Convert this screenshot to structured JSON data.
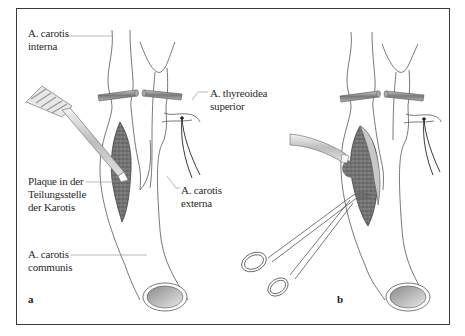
{
  "figure": {
    "panels": [
      {
        "id": "a",
        "letter": "a"
      },
      {
        "id": "b",
        "letter": "b"
      }
    ],
    "labels": {
      "carotis_interna": {
        "line1": "A. carotis",
        "line2": "interna"
      },
      "thyreoidea_superior": {
        "line1": "A. thyreoidea",
        "line2": "superior"
      },
      "plaque": {
        "line1": "Plaque in der",
        "line2": "Teilungsstelle",
        "line3": "der Karotis"
      },
      "carotis_externa": {
        "line1": "A. carotis",
        "line2": "externa"
      },
      "carotis_communis": {
        "line1": "A. carotis",
        "line2": "communis"
      }
    },
    "colors": {
      "frame": "#3a3a3a",
      "vessel_outline": "#555555",
      "plaque_fill": "#6e6e6e",
      "clamp_band": "#8a8a8a",
      "label_text": "#2a2a2a",
      "leader_line": "#8c8c8c"
    },
    "instruments": {
      "panel_a": "dissector-spatula",
      "panel_b": [
        "suction-tube",
        "scissors-forceps"
      ]
    }
  }
}
